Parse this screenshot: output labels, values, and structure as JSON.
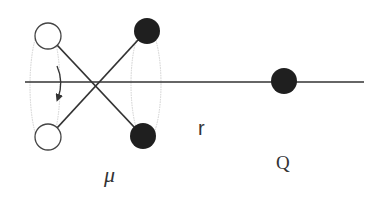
{
  "diagram": {
    "title": "",
    "colors": {
      "line": "#333333",
      "filled": "#1f1f1f",
      "open_fill": "#ffffff",
      "open_stroke": "#444444",
      "ellipse": "#c8c8c8",
      "arrow": "#333333"
    },
    "axis_line": {
      "x1": 25,
      "y1": 82,
      "x2": 364,
      "y2": 82
    },
    "crossing_point": {
      "x": 96,
      "y": 82
    },
    "dipole_left_open": [
      {
        "name": "open-charge-top",
        "cx": 48,
        "cy": 36,
        "r": 13
      },
      {
        "name": "open-charge-bottom",
        "cx": 48,
        "cy": 137,
        "r": 13
      }
    ],
    "dipole_right_filled": [
      {
        "name": "filled-charge-top",
        "cx": 147,
        "cy": 31,
        "r": 13
      },
      {
        "name": "filled-charge-bottom",
        "cx": 143,
        "cy": 136,
        "r": 13
      }
    ],
    "rotation_ellipses": [
      {
        "cx": 45,
        "cy": 86,
        "rx": 15,
        "ry": 62
      },
      {
        "cx": 146,
        "cy": 84,
        "rx": 15,
        "ry": 58
      }
    ],
    "point_charge": {
      "name": "Q",
      "cx": 284,
      "cy": 81,
      "r": 13
    },
    "labels": {
      "mu": "μ",
      "r": "r",
      "Q": "Q"
    },
    "label_positions": {
      "mu": {
        "x": 104,
        "y": 182
      },
      "r": {
        "x": 198,
        "y": 135
      },
      "Q": {
        "x": 277,
        "y": 169
      }
    }
  }
}
